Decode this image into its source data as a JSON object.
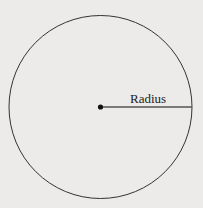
{
  "diagram": {
    "label": "Radius",
    "background": "#ecebe9",
    "stroke": "#333333",
    "radius_line_color": "#444444"
  }
}
